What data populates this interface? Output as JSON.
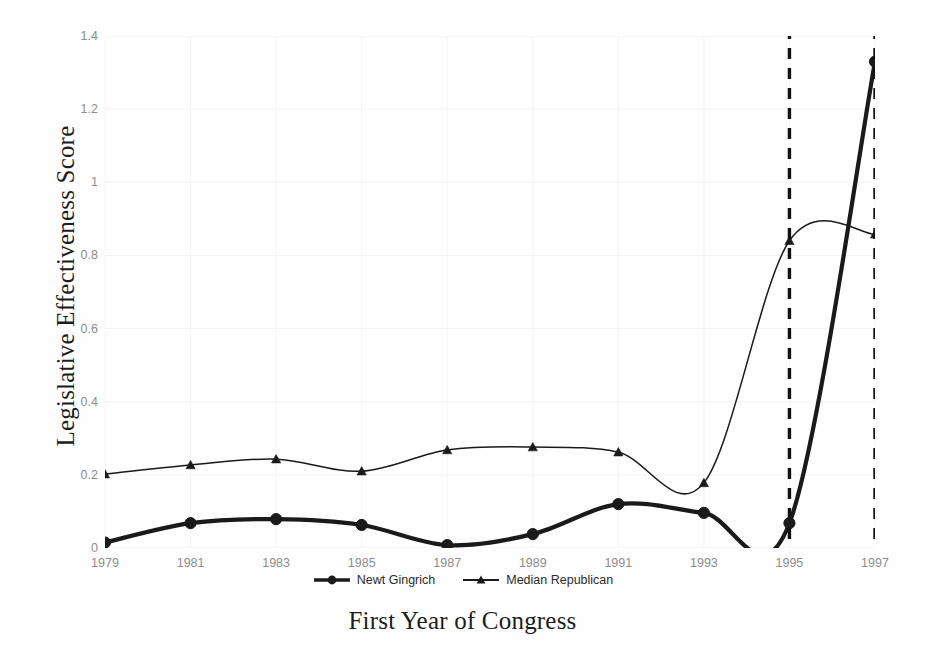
{
  "chart_data": {
    "type": "line",
    "title": "",
    "xlabel": "First Year of Congress",
    "ylabel": "Legislative Effectiveness Score",
    "x": [
      1979,
      1981,
      1983,
      1985,
      1987,
      1989,
      1991,
      1993,
      1995,
      1997
    ],
    "xticklabels": [
      "1979",
      "1981",
      "1983",
      "1985",
      "1987",
      "1989",
      "1991",
      "1993",
      "1995",
      "1997"
    ],
    "yticklabels": [
      "0",
      "0.2",
      "0.4",
      "0.6",
      "0.8",
      "1",
      "1.2",
      "1.4"
    ],
    "ytickvalues": [
      0,
      0.2,
      0.4,
      0.6,
      0.8,
      1,
      1.2,
      1.4
    ],
    "xlim": [
      1979,
      1997
    ],
    "ylim": [
      0,
      1.4
    ],
    "grid": true,
    "smoothing": "spline",
    "legend_position": "bottom-center",
    "series": [
      {
        "name": "Newt Gingrich",
        "marker": "circle",
        "linewidth": "thick",
        "color": "#1a1a1a",
        "values": [
          0.015,
          0.068,
          0.079,
          0.063,
          0.008,
          0.038,
          0.12,
          0.096,
          0.068,
          1.33
        ]
      },
      {
        "name": "Median Republican",
        "marker": "triangle",
        "linewidth": "thin",
        "color": "#1a1a1a",
        "values": [
          0.202,
          0.227,
          0.243,
          0.21,
          0.268,
          0.276,
          0.262,
          0.178,
          0.84,
          0.858
        ]
      }
    ],
    "annotations": [
      {
        "type": "vline",
        "x": 1995,
        "style": "dashed",
        "color": "#111111"
      },
      {
        "type": "vline",
        "x": 1997,
        "style": "dashed",
        "color": "#111111"
      }
    ]
  },
  "legend": {
    "items": [
      {
        "label": "Newt Gingrich",
        "marker": "circle"
      },
      {
        "label": "Median Republican",
        "marker": "triangle"
      }
    ]
  },
  "colors": {
    "ink": "#1a1a1a",
    "tick_text": "#8d8d8d",
    "axis_title": "#1d1d1d",
    "grid": "#f4f4f6",
    "background": "#fefefe"
  }
}
